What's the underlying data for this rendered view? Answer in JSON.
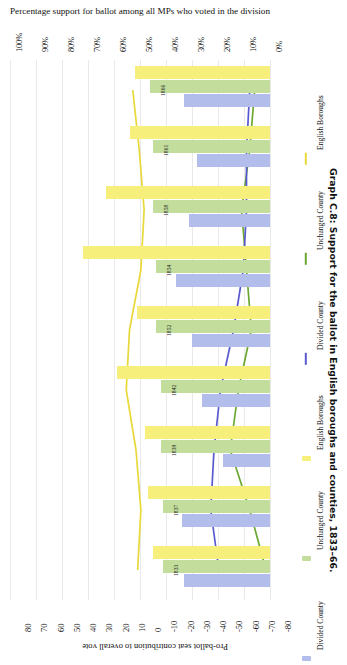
{
  "headline": "Percentage support for ballot among all MPs who voted in the division",
  "caption": "Graph C.8: Support for the ballot in English boroughs and counties, 1833–66.",
  "axis_value_label": "Pro-ballot seat contribution to overall vote",
  "colors": {
    "english_boroughs": "#f7ef7c",
    "unchanged_county": "#c2dd9c",
    "divided_county": "#b3bdec",
    "line_english_boroughs": "#e8d83a",
    "line_unchanged_county": "#6aa832",
    "line_divided_county": "#5a5ad0",
    "gridline": "#e9e9e9"
  },
  "legend": {
    "entries": [
      {
        "label": "Divided County",
        "kind": "bar",
        "color": "#b3bdec"
      },
      {
        "label": "Unchanged County",
        "kind": "bar",
        "color": "#c2dd9c"
      },
      {
        "label": "English Boroughs",
        "kind": "bar",
        "color": "#f7ef7c"
      },
      {
        "label": "Divided County",
        "kind": "line",
        "color": "#5a5ad0"
      },
      {
        "label": "Unchanged County",
        "kind": "line",
        "color": "#6aa832"
      },
      {
        "label": "English Boroughs",
        "kind": "line",
        "color": "#e8d83a"
      }
    ]
  },
  "chart_data": {
    "type": "bar",
    "title": "Percentage support for ballot among all MPs who voted in the division",
    "orientation": "horizontal",
    "categories": [
      "1866",
      "1861",
      "1858",
      "1854",
      "1852",
      "1842",
      "1839",
      "1837",
      "1833"
    ],
    "percent_axis": {
      "label": "Percentage support for ballot among all MPs who voted in the division",
      "ticks": [
        "100%",
        "90%",
        "80%",
        "70%",
        "60%",
        "50%",
        "40%",
        "30%",
        "20%",
        "10%",
        "0%"
      ],
      "min": 0,
      "max": 100
    },
    "seat_axis": {
      "label": "Pro-ballot seat contribution to overall vote",
      "ticks": [
        "80",
        "70",
        "60",
        "50",
        "40",
        "30",
        "20",
        "10",
        "0",
        "-10",
        "-20",
        "-30",
        "-40",
        "-50",
        "-60",
        "-70",
        "-80"
      ],
      "min": -80,
      "max": 80
    },
    "grid": true,
    "legend_position": "right",
    "series": [
      {
        "name": "English Boroughs",
        "type": "bar",
        "color": "#f7ef7c",
        "values": [
          52,
          54,
          63,
          72,
          51,
          59,
          48,
          47,
          45
        ]
      },
      {
        "name": "Unchanged County",
        "type": "bar",
        "color": "#c2dd9c",
        "values": [
          46,
          45,
          45,
          44,
          44,
          42,
          42,
          41,
          41
        ]
      },
      {
        "name": "Divided County",
        "type": "bar",
        "color": "#b3bdec",
        "values": [
          33,
          28,
          31,
          36,
          30,
          26,
          18,
          34,
          33
        ]
      },
      {
        "name": "English Boroughs",
        "type": "line",
        "color": "#e8d83a",
        "values": [
          10,
          6,
          3,
          5,
          12,
          14,
          8,
          5,
          7
        ]
      },
      {
        "name": "Unchanged County",
        "type": "line",
        "color": "#6aa832",
        "values": [
          -65,
          -62,
          -57,
          -60,
          -63,
          -55,
          -50,
          -62,
          -72
        ]
      },
      {
        "name": "Divided County",
        "type": "line",
        "color": "#5a5ad0",
        "values": [
          -62,
          -60,
          -60,
          -58,
          -52,
          -44,
          -40,
          -38,
          -43
        ]
      }
    ]
  }
}
